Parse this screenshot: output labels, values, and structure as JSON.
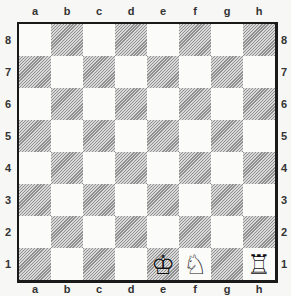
{
  "board": {
    "files": [
      "a",
      "b",
      "c",
      "d",
      "e",
      "f",
      "g",
      "h"
    ],
    "ranks": [
      "8",
      "7",
      "6",
      "5",
      "4",
      "3",
      "2",
      "1"
    ],
    "colors": {
      "light": "#fbfbf9",
      "dark": "#bdbdbd",
      "border": "#1a1a1a"
    },
    "pieces": [
      {
        "square": "e1",
        "piece": "king",
        "color": "white",
        "glyph": "♔"
      },
      {
        "square": "f1",
        "piece": "knight",
        "color": "white",
        "glyph": "♘"
      },
      {
        "square": "h1",
        "piece": "rook",
        "color": "white",
        "glyph": "♖"
      }
    ]
  }
}
